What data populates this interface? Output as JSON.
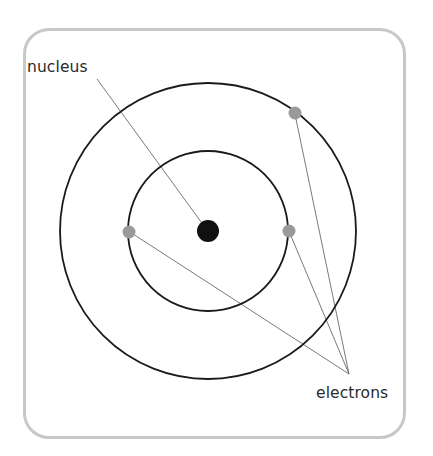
{
  "diagram": {
    "labels": {
      "nucleus": "nucleus",
      "electrons": "electrons"
    },
    "colors": {
      "frame": "#c8c8c8",
      "orbit": "#1a1a1a",
      "nucleus": "#111111",
      "electron": "#9a9a9a",
      "leader": "#6a6a6a",
      "text": "#2a2a2a"
    },
    "nucleus": {
      "cx": 208,
      "cy": 231,
      "r": 11
    },
    "orbits": [
      {
        "name": "inner-orbit",
        "cx": 208,
        "cy": 231,
        "r": 80
      },
      {
        "name": "outer-orbit",
        "cx": 208,
        "cy": 231,
        "r": 148
      }
    ],
    "electrons": [
      {
        "cx": 129,
        "cy": 232,
        "r": 6.5
      },
      {
        "cx": 289,
        "cy": 231,
        "r": 6.5
      },
      {
        "cx": 295,
        "cy": 113,
        "r": 6.5
      }
    ],
    "leaders": {
      "nucleus": {
        "x1": 97,
        "y1": 79,
        "x2": 204,
        "y2": 226
      },
      "electrons_target": {
        "x": 349,
        "y": 374
      }
    }
  }
}
